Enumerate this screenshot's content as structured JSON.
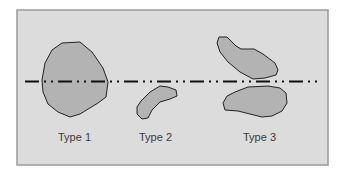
{
  "diagram": {
    "background_color": "#dcdcdc",
    "border_color": "#9a9a9a",
    "shape_fill": "#b3b3b3",
    "shape_stroke": "#222222",
    "line_style": "dash-dot-dot",
    "types": [
      {
        "label": "Type 1",
        "description": "single large shape crossing the line"
      },
      {
        "label": "Type 2",
        "description": "single small shape below the line"
      },
      {
        "label": "Type 3",
        "description": "two shapes, one above and one below the line"
      }
    ]
  }
}
